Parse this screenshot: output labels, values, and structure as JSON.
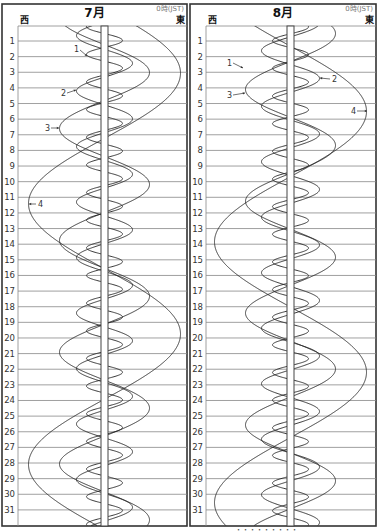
{
  "caption_partial": "・・・・・・・・・",
  "panels": [
    {
      "id": "july",
      "month_label": "7月",
      "west_label": "西",
      "east_label": "東",
      "tz_label": "0時(JST)",
      "frame": {
        "x": 2,
        "y": 4,
        "w": 185,
        "h": 522
      },
      "plot": {
        "x0": 18,
        "x1": 187,
        "y0": 26
      },
      "center_x": 104.5,
      "band_width": 7,
      "day_labels": [
        "1",
        "2",
        "3",
        "4",
        "5",
        "6",
        "7",
        "8",
        "9",
        "10",
        "11",
        "12",
        "13",
        "14",
        "15",
        "16",
        "17",
        "18",
        "19",
        "20",
        "21",
        "22",
        "23",
        "24",
        "25",
        "26",
        "27",
        "28",
        "29",
        "30",
        "31"
      ],
      "moons": [
        {
          "id": "1",
          "amplitude": 18,
          "period": 1.769,
          "west_day": 1.85
        },
        {
          "id": "2",
          "amplitude": 28,
          "period": 3.551,
          "west_day": 4.2
        },
        {
          "id": "3",
          "amplitude": 45,
          "period": 7.155,
          "west_day": 6.6
        },
        {
          "id": "4",
          "amplitude": 76,
          "period": 16.69,
          "west_day": 11.4
        }
      ],
      "labels": [
        {
          "text": "1",
          "x": 74,
          "y": 52,
          "ax1": 80,
          "ay1": 50,
          "ax2": 87,
          "ay2": 56
        },
        {
          "text": "2",
          "x": 61,
          "y": 96,
          "ax1": 67,
          "ay1": 93,
          "ax2": 76,
          "ay2": 90
        },
        {
          "text": "3",
          "x": 45,
          "y": 131,
          "ax1": 51,
          "ay1": 128,
          "ax2": 59,
          "ay2": 128
        },
        {
          "text": "4",
          "x": 38,
          "y": 207,
          "ax1": 36,
          "ay1": 204,
          "ax2": 29,
          "ay2": 204
        }
      ]
    },
    {
      "id": "august",
      "month_label": "8月",
      "west_label": "西",
      "east_label": "東",
      "tz_label": "0時(JST)",
      "frame": {
        "x": 190,
        "y": 4,
        "w": 186,
        "h": 522
      },
      "plot": {
        "x0": 206,
        "x1": 376,
        "y0": 26
      },
      "center_x": 290.5,
      "band_width": 7,
      "day_labels": [
        "1",
        "2",
        "3",
        "4",
        "5",
        "6",
        "7",
        "8",
        "9",
        "10",
        "11",
        "12",
        "13",
        "14",
        "15",
        "16",
        "17",
        "18",
        "19",
        "20",
        "21",
        "22",
        "23",
        "24",
        "25",
        "26",
        "27",
        "28",
        "29",
        "30",
        "31"
      ],
      "moons": [
        {
          "id": "1",
          "amplitude": 18,
          "period": 1.769,
          "west_day": 2.75
        },
        {
          "id": "2",
          "amplitude": 29,
          "period": 3.551,
          "west_day": 1.62
        },
        {
          "id": "3",
          "amplitude": 45,
          "period": 7.155,
          "west_day": 4.1
        },
        {
          "id": "4",
          "amplitude": 76,
          "period": 16.69,
          "west_day": 13.85
        }
      ],
      "labels": [
        {
          "text": "1",
          "x": 227,
          "y": 66,
          "ax1": 233,
          "ay1": 63,
          "ax2": 243,
          "ay2": 68
        },
        {
          "text": "3",
          "x": 227,
          "y": 98,
          "ax1": 233,
          "ay1": 95,
          "ax2": 245,
          "ay2": 93
        },
        {
          "text": "2",
          "x": 332,
          "y": 82,
          "ax1": 330,
          "ay1": 79,
          "ax2": 320,
          "ay2": 78
        },
        {
          "text": "4",
          "x": 351,
          "y": 114,
          "ax1": 357,
          "ay1": 111,
          "ax2": 367,
          "ay2": 111
        }
      ]
    }
  ],
  "layout": {
    "row1_y": 41,
    "row_spacing": 15.63,
    "day_start": 0.0,
    "day_end": 32.0
  }
}
